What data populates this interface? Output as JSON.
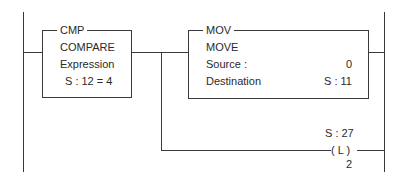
{
  "diagram": {
    "type": "ladder-logic-rung",
    "cmp_block": {
      "mnemonic": "CMP",
      "name": "COMPARE",
      "expression_label": "Expression",
      "expression": "S : 12 = 4"
    },
    "mov_block": {
      "mnemonic": "MOV",
      "name": "MOVE",
      "source_label": "Source :",
      "source_value": "0",
      "destination_label": "Destination",
      "destination_value": "S : 11"
    },
    "latch_coil": {
      "address": "S : 27",
      "symbol": "( L )",
      "bit": "2"
    }
  }
}
